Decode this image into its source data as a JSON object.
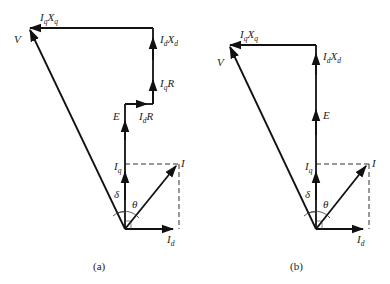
{
  "diagrams": [
    {
      "id": "a",
      "caption": "(a)",
      "labels": {
        "V": "V",
        "IqXq_main": "I",
        "IqXq_sub1": "q",
        "IqXq_x": "X",
        "IqXq_sub2": "q",
        "IdXd_main": "I",
        "IdXd_sub1": "d",
        "IdXd_x": "X",
        "IdXd_sub2": "d",
        "IqR_main": "I",
        "IqR_sub": "q",
        "IqR_r": "R",
        "IdR_main": "I",
        "IdR_sub": "d",
        "IdR_r": "R",
        "E": "E",
        "Iq_main": "I",
        "Iq_sub": "q",
        "I": "I",
        "Id_main": "I",
        "Id_sub": "d",
        "delta": "δ",
        "theta": "θ"
      }
    },
    {
      "id": "b",
      "caption": "(b)",
      "labels": {
        "V": "V",
        "IqXq_main": "I",
        "IqXq_sub1": "q",
        "IqXq_x": "X",
        "IqXq_sub2": "q",
        "IdXd_main": "I",
        "IdXd_sub1": "d",
        "IdXd_x": "X",
        "IdXd_sub2": "d",
        "E": "E",
        "Iq_main": "I",
        "Iq_sub": "q",
        "I": "I",
        "Id_main": "I",
        "Id_sub": "d",
        "delta": "δ",
        "theta": "θ"
      }
    }
  ]
}
